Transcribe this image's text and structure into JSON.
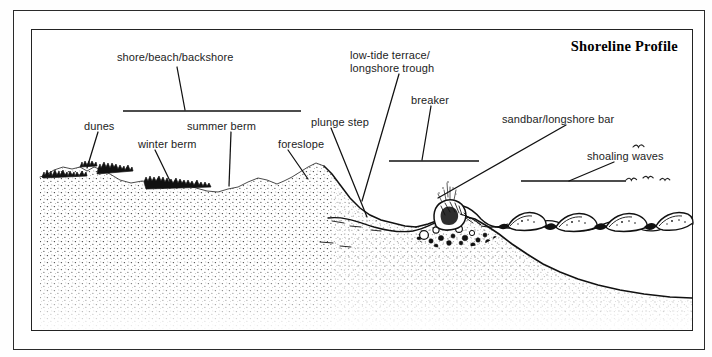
{
  "figure": {
    "title": "Shoreline Profile",
    "labels": [
      {
        "name": "shore-beach-backshore",
        "text": "shore/beach/backshore",
        "x": 117,
        "y": 51
      },
      {
        "name": "dunes",
        "text": "dunes",
        "x": 84,
        "y": 120
      },
      {
        "name": "winter-berm",
        "text": "winter berm",
        "x": 138,
        "y": 138
      },
      {
        "name": "summer-berm",
        "text": "summer berm",
        "x": 187,
        "y": 120
      },
      {
        "name": "foreslope",
        "text": "foreslope",
        "x": 278,
        "y": 138
      },
      {
        "name": "plunge-step",
        "text": "plunge step",
        "x": 311,
        "y": 116
      },
      {
        "name": "low-tide-terrace",
        "text": "low-tide terrace/",
        "x": 350,
        "y": 49
      },
      {
        "name": "longshore-trough",
        "text": "longshore trough",
        "x": 350,
        "y": 62
      },
      {
        "name": "breaker",
        "text": "breaker",
        "x": 411,
        "y": 94
      },
      {
        "name": "sandbar-longshore-bar",
        "text": "sandbar/longshore bar",
        "x": 502,
        "y": 113
      },
      {
        "name": "shoaling-waves",
        "text": "shoaling waves",
        "x": 587,
        "y": 150
      }
    ],
    "extent_bars": [
      {
        "name": "shore-extent-bar",
        "x1": 122,
        "x2": 300,
        "y": 110
      },
      {
        "name": "breaker-extent-bar",
        "x1": 388,
        "x2": 478,
        "y": 160
      },
      {
        "name": "shoaling-extent-bar",
        "x1": 520,
        "x2": 625,
        "y": 180
      }
    ],
    "leader_lines": [
      {
        "name": "leader-shore-beach-backshore",
        "x1": 176,
        "y1": 66,
        "x2": 184,
        "y2": 109
      },
      {
        "name": "leader-dunes",
        "x1": 97,
        "y1": 131,
        "x2": 86,
        "y2": 167
      },
      {
        "name": "leader-winter-berm",
        "x1": 154,
        "y1": 149,
        "x2": 169,
        "y2": 180
      },
      {
        "name": "leader-summer-berm",
        "x1": 230,
        "y1": 131,
        "x2": 228,
        "y2": 185
      },
      {
        "name": "leader-foreslope",
        "x1": 287,
        "y1": 149,
        "x2": 307,
        "y2": 178
      },
      {
        "name": "leader-plunge-step",
        "x1": 330,
        "y1": 127,
        "x2": 366,
        "y2": 216
      },
      {
        "name": "leader-low-tide-terrace",
        "x1": 398,
        "y1": 73,
        "x2": 361,
        "y2": 200
      },
      {
        "name": "leader-breaker",
        "x1": 430,
        "y1": 105,
        "x2": 421,
        "y2": 159
      },
      {
        "name": "leader-sandbar",
        "x1": 565,
        "y1": 124,
        "x2": 437,
        "y2": 197
      },
      {
        "name": "leader-shoaling-waves",
        "x1": 613,
        "y1": 161,
        "x2": 568,
        "y2": 180
      }
    ],
    "elements": {
      "sand_fill": "stippled",
      "dune_vegetation": "dark tufts",
      "breaker": "plunging breaker with spray",
      "plunge_step_deposit": "cobbles and pebbles",
      "shoaling_waves_count": 4,
      "birds_count": 4
    },
    "colors": {
      "ink": "#1a1a1a",
      "frame": "#2b2b2b",
      "paper": "#ffffff",
      "stipple": "#3a3a3a"
    }
  }
}
